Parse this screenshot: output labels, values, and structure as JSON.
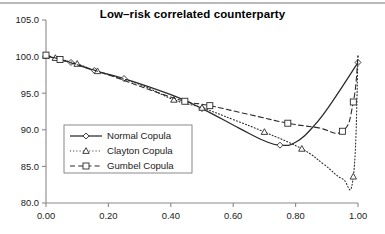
{
  "figure": {
    "width": 385,
    "height": 234,
    "background": "#ffffff",
    "top_rule_color": "#b9b9b9"
  },
  "chart_data": {
    "type": "line",
    "title": "Low–risk correlated counterparty",
    "xlabel": "",
    "ylabel": "",
    "xlim": [
      0.0,
      1.0
    ],
    "ylim": [
      80.0,
      105.0
    ],
    "xticks": [
      0.0,
      0.2,
      0.4,
      0.6,
      0.8,
      1.0
    ],
    "xtick_labels": [
      "0.00",
      "0.20",
      "0.40",
      "0.60",
      "0.80",
      "1.00"
    ],
    "yticks": [
      80.0,
      85.0,
      90.0,
      95.0,
      100.0,
      105.0
    ],
    "ytick_labels": [
      "80.0",
      "85.0",
      "90.0",
      "95.0",
      "100.0",
      "105.0"
    ],
    "grid": false,
    "legend_position": "center-left",
    "line_color": "#2a2a2a",
    "series": [
      {
        "name": "Normal Copula",
        "marker": "diamond",
        "linestyle": "solid",
        "x": [
          0.0,
          0.08,
          0.155,
          0.25,
          0.4,
          0.5,
          0.62,
          0.7,
          0.75,
          0.8,
          0.86,
          0.92,
          1.0
        ],
        "values": [
          100.1,
          99.2,
          98.1,
          97.0,
          94.8,
          92.9,
          90.2,
          88.5,
          87.9,
          88.3,
          90.6,
          94.0,
          99.2
        ],
        "marker_x": [
          0.0,
          0.08,
          0.155,
          0.25,
          0.5,
          0.75,
          1.0
        ],
        "marker_values": [
          100.1,
          99.2,
          98.1,
          97.0,
          92.9,
          87.9,
          99.2
        ]
      },
      {
        "name": "Clayton Copula",
        "marker": "triangle",
        "linestyle": "dotted",
        "x": [
          0.0,
          0.03,
          0.1,
          0.165,
          0.3,
          0.41,
          0.5,
          0.6,
          0.7,
          0.82,
          0.89,
          0.95,
          0.985,
          1.0
        ],
        "values": [
          100.1,
          99.8,
          99.0,
          98.0,
          96.2,
          94.1,
          93.0,
          91.4,
          89.7,
          87.4,
          85.3,
          83.3,
          83.6,
          100.1
        ],
        "marker_x": [
          0.0,
          0.03,
          0.1,
          0.165,
          0.41,
          0.5,
          0.7,
          0.82,
          0.985
        ],
        "marker_values": [
          100.1,
          99.8,
          99.0,
          98.0,
          94.1,
          93.0,
          89.7,
          87.4,
          83.6
        ]
      },
      {
        "name": "Gumbel Copula",
        "marker": "square",
        "linestyle": "dashed",
        "x": [
          0.0,
          0.045,
          0.2,
          0.35,
          0.445,
          0.525,
          0.65,
          0.775,
          0.87,
          0.95,
          0.985,
          1.0
        ],
        "values": [
          100.2,
          99.6,
          97.5,
          95.2,
          93.9,
          93.3,
          92.1,
          90.9,
          90.3,
          89.8,
          93.8,
          100.1
        ],
        "marker_x": [
          0.0,
          0.045,
          0.445,
          0.525,
          0.775,
          0.95,
          0.985
        ],
        "marker_values": [
          100.2,
          99.6,
          93.9,
          93.3,
          90.9,
          89.8,
          93.8
        ]
      }
    ]
  },
  "legend": {
    "entries": [
      {
        "label": "Normal Copula",
        "marker": "diamond",
        "linestyle": "solid"
      },
      {
        "label": "Clayton Copula",
        "marker": "triangle",
        "linestyle": "dotted"
      },
      {
        "label": "Gumbel Copula",
        "marker": "square",
        "linestyle": "dashed"
      }
    ]
  }
}
